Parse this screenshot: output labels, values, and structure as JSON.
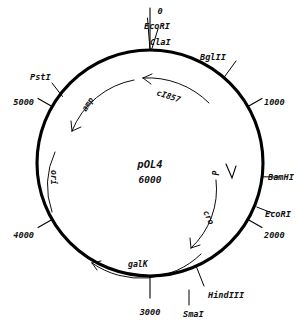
{
  "figure": {
    "type": "plasmid-map",
    "plasmid_name": "pOL4",
    "plasmid_size": "6000"
  },
  "center": {
    "name": "pOL4",
    "size": "6000"
  },
  "coordinates": [
    {
      "label": "0",
      "position_bp": 0,
      "angle_deg": 0
    },
    {
      "label": "1000",
      "position_bp": 1000,
      "angle_deg": 60
    },
    {
      "label": "2000",
      "position_bp": 2000,
      "angle_deg": 120
    },
    {
      "label": "3000",
      "position_bp": 3000,
      "angle_deg": 180
    },
    {
      "label": "4000",
      "position_bp": 4000,
      "angle_deg": 240
    },
    {
      "label": "5000",
      "position_bp": 5000,
      "angle_deg": 300
    }
  ],
  "restriction_sites": [
    {
      "label": "EcoRI",
      "angle_deg": 0
    },
    {
      "label": "ClaI",
      "angle_deg": 3
    },
    {
      "label": "BglII",
      "angle_deg": 41
    },
    {
      "label": "BamHI",
      "angle_deg": 97
    },
    {
      "label": "EcoRI",
      "angle_deg": 113
    },
    {
      "label": "HindIII",
      "angle_deg": 158
    },
    {
      "label": "SmaI",
      "angle_deg": 163
    }
  ],
  "genes": [
    {
      "label": "cI857",
      "direction": "counterclockwise"
    },
    {
      "label": "amp",
      "direction": "counterclockwise"
    },
    {
      "label": "ori",
      "direction": "none"
    },
    {
      "label": "galK",
      "direction": "counterclockwise"
    },
    {
      "label": "cro",
      "direction": "clockwise"
    },
    {
      "label": "P",
      "direction": "promoter"
    }
  ],
  "colors": {
    "ink": "#000000",
    "background": "#ffffff"
  }
}
